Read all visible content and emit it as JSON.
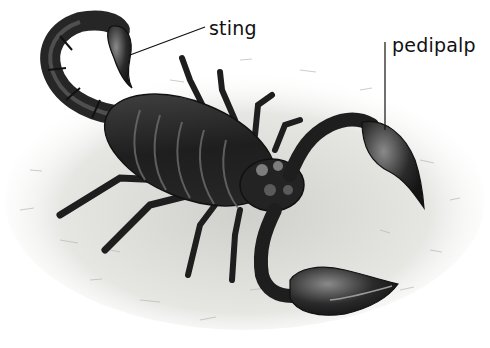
{
  "diagram": {
    "style": "monochrome pencil illustration on textured ground",
    "labels": [
      {
        "id": "sting",
        "text": "sting",
        "points_to": "tail stinger (telson)"
      },
      {
        "id": "pedipalp",
        "text": "pedipalp",
        "points_to": "right pedipalp claw"
      }
    ],
    "colors": {
      "background": "#ffffff",
      "ground": "#d9d9d6",
      "body_dark": "#1e1e1e",
      "body_mid": "#3a3a3a",
      "highlight": "#8a8a8a",
      "leader_line": "#111111",
      "label_text": "#111111"
    }
  }
}
